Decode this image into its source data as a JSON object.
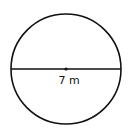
{
  "diagram": {
    "shape": "circle",
    "diameter_label": "7 m",
    "stroke_color": "#111111",
    "background": "#ffffff"
  }
}
